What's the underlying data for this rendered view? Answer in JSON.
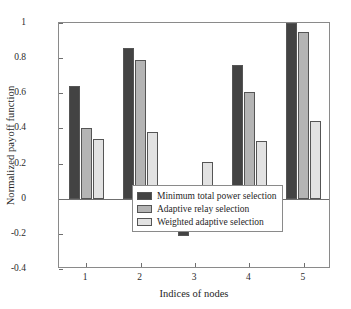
{
  "chart_data": {
    "type": "bar",
    "title": "",
    "xlabel": "Indices of nodes",
    "ylabel": "Normalized payoff function",
    "categories": [
      "1",
      "2",
      "3",
      "4",
      "5"
    ],
    "xtick_labels": [
      "1",
      "2",
      "3",
      "4",
      "5"
    ],
    "ytick_labels": [
      "1",
      "0.8",
      "0.6",
      "0.4",
      "0.2",
      "0",
      "-0.2",
      "-0.4"
    ],
    "ytick_values": [
      1,
      0.8,
      0.6,
      0.4,
      0.2,
      0,
      -0.2,
      -0.4
    ],
    "ylim": [
      -0.4,
      1
    ],
    "grid": false,
    "legend_position": "lower center",
    "series": [
      {
        "name": "Minimum total power selection",
        "color": "#434343",
        "values": [
          0.64,
          0.86,
          -0.21,
          0.76,
          1.0
        ]
      },
      {
        "name": "Adaptive relay selection",
        "color": "#b4b4b4",
        "values": [
          0.4,
          0.79,
          0.0,
          0.61,
          0.95
        ]
      },
      {
        "name": "Weighted adaptive selection",
        "color": "#e2e2e2",
        "values": [
          0.34,
          0.38,
          0.21,
          0.33,
          0.44
        ]
      }
    ]
  }
}
